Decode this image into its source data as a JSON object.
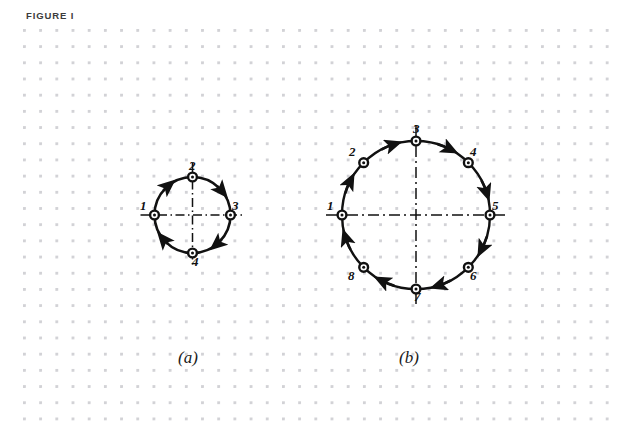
{
  "figure": {
    "title": "FIGURE I",
    "background_color": "#ffffff",
    "grid_dot_color": "#d2d2d6",
    "ink_color": "#111111"
  },
  "panels": [
    {
      "id": "a",
      "caption": "(a)",
      "center": {
        "x": 192.5,
        "y": 215
      },
      "radius": 38,
      "direction": "clockwise",
      "axes": [
        "horizontal",
        "vertical"
      ],
      "nodes": [
        {
          "label": "1",
          "angle_deg": 180,
          "label_x": 140,
          "label_y": 199
        },
        {
          "label": "2",
          "angle_deg": 270,
          "label_x": 189,
          "label_y": 159
        },
        {
          "label": "3",
          "angle_deg": 0,
          "label_x": 232,
          "label_y": 199
        },
        {
          "label": "4",
          "angle_deg": 90,
          "label_x": 192,
          "label_y": 255
        }
      ],
      "arrow_angles_deg": [
        225,
        315,
        45,
        135
      ]
    },
    {
      "id": "b",
      "caption": "(b)",
      "center": {
        "x": 416,
        "y": 215
      },
      "radius": 74,
      "direction": "clockwise",
      "axes": [
        "horizontal",
        "vertical"
      ],
      "nodes": [
        {
          "label": "1",
          "angle_deg": 180,
          "label_x": 327,
          "label_y": 199
        },
        {
          "label": "2",
          "angle_deg": 225,
          "label_x": 349,
          "label_y": 145
        },
        {
          "label": "3",
          "angle_deg": 270,
          "label_x": 413,
          "label_y": 122
        },
        {
          "label": "4",
          "angle_deg": 315,
          "label_x": 470,
          "label_y": 145
        },
        {
          "label": "5",
          "angle_deg": 0,
          "label_x": 492,
          "label_y": 199
        },
        {
          "label": "6",
          "angle_deg": 45,
          "label_x": 470,
          "label_y": 269
        },
        {
          "label": "7",
          "angle_deg": 90,
          "label_x": 414,
          "label_y": 290
        },
        {
          "label": "8",
          "angle_deg": 135,
          "label_x": 348,
          "label_y": 269
        }
      ],
      "arrow_angles_deg": [
        247,
        292,
        337,
        22,
        67,
        112,
        157,
        202
      ]
    }
  ]
}
